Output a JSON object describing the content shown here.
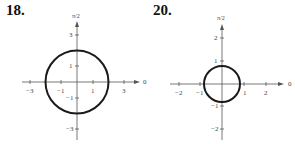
{
  "figures": [
    {
      "number": "18.",
      "axis_top_label": "π/2",
      "axis_right_label": "0",
      "x_ticks": [
        {
          "v": -3,
          "label": "−3"
        },
        {
          "v": -1,
          "label": "−1"
        },
        {
          "v": 1,
          "label": "1"
        },
        {
          "v": 3,
          "label": "3"
        }
      ],
      "y_ticks": [
        {
          "v": 3,
          "label": "3"
        },
        {
          "v": 1,
          "label": "1"
        },
        {
          "v": -1,
          "label": "−1"
        },
        {
          "v": -3,
          "label": "−3"
        }
      ],
      "curve": {
        "type": "circle",
        "center": [
          0,
          0
        ],
        "radius": 2
      }
    },
    {
      "number": "20.",
      "axis_top_label": "π/2",
      "axis_right_label": "0",
      "x_ticks": [
        {
          "v": -2,
          "label": "−2"
        },
        {
          "v": -1,
          "label": "−1"
        },
        {
          "v": 1,
          "label": "1"
        },
        {
          "v": 2,
          "label": "2"
        }
      ],
      "y_ticks": [
        {
          "v": 2,
          "label": "2"
        },
        {
          "v": 1,
          "label": "1"
        },
        {
          "v": -1,
          "label": "−1"
        },
        {
          "v": -2,
          "label": "−2"
        }
      ],
      "curve": {
        "type": "circle",
        "center": [
          0,
          0
        ],
        "radius": 0.8
      }
    }
  ]
}
